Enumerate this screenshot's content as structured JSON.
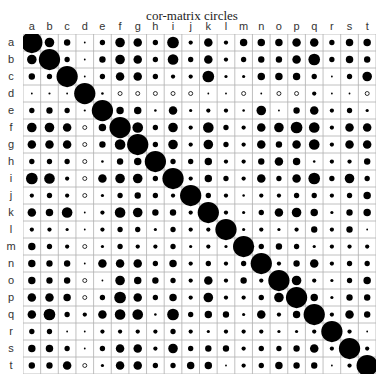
{
  "title": "cor-matrix circles",
  "chart_data": {
    "type": "heatmap",
    "subtype": "correlation-circles",
    "title": "cor-matrix circles",
    "variables": [
      "a",
      "b",
      "c",
      "d",
      "e",
      "f",
      "g",
      "h",
      "i",
      "j",
      "k",
      "l",
      "m",
      "n",
      "o",
      "p",
      "q",
      "r",
      "s",
      "t"
    ],
    "encoding": "circle area/diameter proportional to |r|; filled black = positive, hollow = negative",
    "colors": {
      "positive": "#000000",
      "negative_stroke": "#000000",
      "grid": "#b0b0b0",
      "background": "#ffffff"
    },
    "matrix": [
      [
        1.0,
        0.45,
        0.3,
        0.05,
        0.25,
        0.45,
        0.4,
        0.25,
        0.55,
        0.2,
        0.4,
        0.2,
        0.35,
        0.35,
        0.35,
        0.4,
        0.4,
        0.25,
        0.35,
        0.35
      ],
      [
        0.45,
        1.0,
        0.25,
        0.08,
        0.3,
        0.45,
        0.4,
        0.25,
        0.5,
        0.25,
        0.4,
        0.2,
        0.25,
        0.3,
        0.3,
        0.4,
        0.55,
        0.25,
        0.35,
        0.3
      ],
      [
        0.3,
        0.25,
        1.0,
        0.05,
        0.25,
        0.4,
        0.4,
        0.25,
        0.2,
        0.2,
        0.55,
        0.15,
        0.15,
        0.35,
        0.35,
        0.35,
        0.25,
        0.06,
        0.25,
        0.45
      ],
      [
        0.05,
        0.1,
        0.05,
        1.0,
        0.12,
        -0.1,
        -0.15,
        -0.15,
        -0.15,
        -0.12,
        0.05,
        0.05,
        -0.12,
        0.08,
        -0.12,
        -0.12,
        0.2,
        0.06,
        0.06,
        -0.15
      ],
      [
        0.25,
        0.3,
        0.25,
        0.1,
        1.0,
        0.35,
        0.35,
        0.12,
        0.4,
        0.15,
        0.2,
        0.2,
        0.12,
        0.45,
        0.06,
        0.3,
        0.4,
        0.2,
        0.25,
        0.15
      ],
      [
        0.45,
        0.45,
        0.4,
        -0.1,
        0.35,
        1.0,
        0.5,
        0.25,
        0.45,
        0.2,
        0.5,
        0.25,
        0.2,
        0.4,
        0.45,
        0.55,
        0.5,
        0.2,
        0.4,
        0.4
      ],
      [
        0.4,
        0.4,
        0.4,
        -0.15,
        0.3,
        0.5,
        1.0,
        0.25,
        0.45,
        0.2,
        0.45,
        0.25,
        0.2,
        0.4,
        0.3,
        0.4,
        0.5,
        0.2,
        0.4,
        0.4
      ],
      [
        0.25,
        0.25,
        0.25,
        -0.15,
        0.12,
        0.3,
        0.35,
        1.0,
        0.25,
        0.25,
        0.35,
        0.2,
        0.2,
        0.3,
        0.4,
        0.35,
        0.12,
        0.2,
        0.2,
        0.3
      ],
      [
        0.55,
        0.5,
        0.2,
        -0.15,
        0.4,
        0.45,
        0.45,
        0.25,
        1.0,
        0.2,
        0.35,
        0.25,
        0.2,
        0.4,
        0.25,
        0.4,
        0.55,
        0.25,
        0.45,
        0.25
      ],
      [
        0.2,
        0.25,
        0.2,
        -0.12,
        0.15,
        0.25,
        0.3,
        0.25,
        0.2,
        1.0,
        0.25,
        0.2,
        0.12,
        0.2,
        0.2,
        0.25,
        0.25,
        0.2,
        0.25,
        0.35
      ],
      [
        0.4,
        0.35,
        0.5,
        0.05,
        0.2,
        0.5,
        0.45,
        0.3,
        0.3,
        0.2,
        1.0,
        0.2,
        0.15,
        0.25,
        0.4,
        0.45,
        0.35,
        0.15,
        0.3,
        0.35
      ],
      [
        0.2,
        0.2,
        0.15,
        0.05,
        0.2,
        0.25,
        0.25,
        0.15,
        0.25,
        0.2,
        0.2,
        1.0,
        0.15,
        0.2,
        0.15,
        0.2,
        0.3,
        0.2,
        0.3,
        0.06
      ],
      [
        0.35,
        0.25,
        0.2,
        -0.12,
        0.15,
        0.25,
        0.2,
        0.2,
        0.25,
        0.15,
        0.2,
        0.15,
        1.0,
        0.25,
        0.3,
        0.25,
        0.15,
        0.2,
        0.2,
        0.2
      ],
      [
        0.35,
        0.3,
        0.3,
        0.08,
        0.4,
        0.4,
        0.4,
        0.25,
        0.35,
        0.2,
        0.25,
        0.2,
        0.25,
        1.0,
        0.2,
        0.3,
        0.4,
        0.2,
        0.25,
        0.25
      ],
      [
        0.35,
        0.3,
        0.3,
        -0.12,
        0.06,
        0.45,
        0.35,
        0.3,
        0.25,
        0.2,
        0.4,
        0.2,
        0.3,
        0.2,
        1.0,
        0.45,
        0.2,
        0.15,
        0.25,
        0.35
      ],
      [
        0.4,
        0.4,
        0.35,
        -0.12,
        0.25,
        0.55,
        0.4,
        0.25,
        0.35,
        0.2,
        0.45,
        0.2,
        0.2,
        0.25,
        0.45,
        1.0,
        0.35,
        0.15,
        0.3,
        0.3
      ],
      [
        0.4,
        0.55,
        0.25,
        0.2,
        0.4,
        0.5,
        0.5,
        0.12,
        0.55,
        0.25,
        0.35,
        0.3,
        0.15,
        0.4,
        0.2,
        0.35,
        1.0,
        0.2,
        0.4,
        0.3
      ],
      [
        0.25,
        0.25,
        0.06,
        0.06,
        0.2,
        0.2,
        0.2,
        0.2,
        0.25,
        0.2,
        0.15,
        0.2,
        0.2,
        0.2,
        0.15,
        0.15,
        0.2,
        1.0,
        0.2,
        0.06
      ],
      [
        0.35,
        0.35,
        0.25,
        0.06,
        0.25,
        0.4,
        0.4,
        0.2,
        0.45,
        0.25,
        0.3,
        0.3,
        0.2,
        0.25,
        0.25,
        0.3,
        0.4,
        0.2,
        1.0,
        0.2
      ],
      [
        0.3,
        0.3,
        0.4,
        -0.15,
        0.15,
        0.4,
        0.4,
        0.25,
        0.25,
        0.35,
        0.35,
        0.06,
        0.2,
        0.25,
        0.35,
        0.3,
        0.3,
        0.06,
        0.2,
        1.0
      ]
    ],
    "grid": true,
    "legend": "none",
    "xlabel": "",
    "ylabel": "",
    "axis_position": {
      "x": "top",
      "y": "left"
    }
  }
}
